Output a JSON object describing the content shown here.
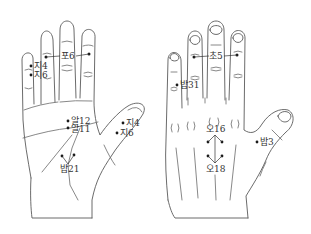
{
  "figure": {
    "colors": {
      "line": "#5a5a5a",
      "point": "#1a1a1a",
      "text": "#333333",
      "background": "#ffffff"
    }
  },
  "palm": {
    "points": [
      {
        "id": "po6",
        "label": "포6"
      },
      {
        "id": "ji4-finger",
        "label": "지4"
      },
      {
        "id": "ji6-finger",
        "label": "지6"
      },
      {
        "id": "al12",
        "label": "알12"
      },
      {
        "id": "al11",
        "label": "알11"
      },
      {
        "id": "bap21",
        "label": "밥21"
      },
      {
        "id": "ji4-thumb",
        "label": "지4"
      },
      {
        "id": "ji6-thumb",
        "label": "지6"
      }
    ]
  },
  "back": {
    "points": [
      {
        "id": "cho5",
        "label": "초5"
      },
      {
        "id": "bap31",
        "label": "밥31"
      },
      {
        "id": "o16",
        "label": "오16"
      },
      {
        "id": "o18",
        "label": "오18"
      },
      {
        "id": "bap3",
        "label": "밥3"
      }
    ]
  }
}
